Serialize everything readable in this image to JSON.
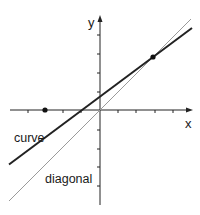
{
  "diagram": {
    "axes": {
      "x_label": "x",
      "y_label": "y",
      "origin_px": [
        100,
        110
      ],
      "tick_spacing_px": 18.3,
      "x_ticks_px": [
        28,
        63,
        81,
        118,
        136,
        155,
        173
      ],
      "y_ticks_px": [
        35,
        54,
        73,
        92,
        130,
        149,
        167,
        186
      ]
    },
    "lines": [
      {
        "name": "curve",
        "label": "curve",
        "style": "thick",
        "color": "#222222",
        "from_px": [
          9,
          164.5
        ],
        "to_px": [
          192,
          28
        ]
      },
      {
        "name": "diagonal",
        "label": "diagonal",
        "style": "thin",
        "color": "#9a9a9a",
        "from_px": [
          9,
          201
        ],
        "to_px": [
          191,
          19
        ]
      }
    ],
    "points": [
      {
        "name": "intersection-point",
        "px": [
          153,
          57
        ]
      },
      {
        "name": "x-axis-point",
        "px": [
          45,
          110
        ]
      }
    ],
    "labels": {
      "curve": "curve",
      "diagonal": "diagonal"
    }
  }
}
